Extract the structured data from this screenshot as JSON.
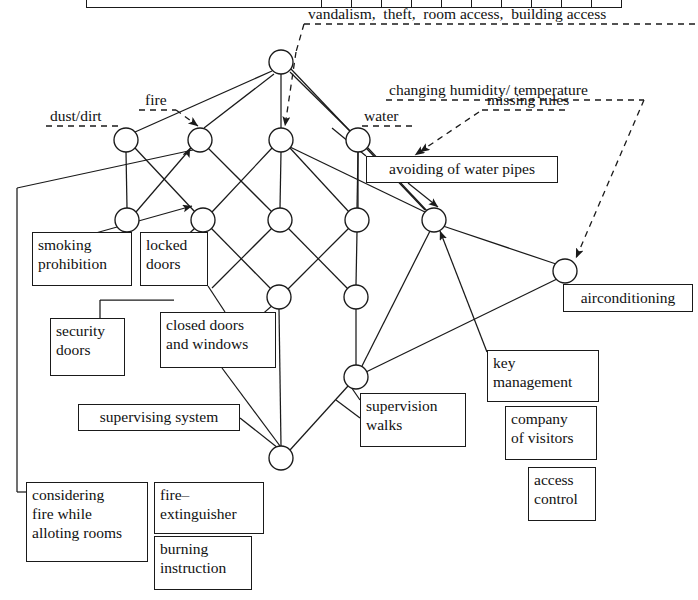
{
  "diagram": {
    "type": "node-link-diagram",
    "colors": {
      "line": "#1a1a1a",
      "node_fill": "#ffffff",
      "text": "#111111",
      "background": "#ffffff"
    }
  },
  "top_table": {
    "visible_fragment": "partially cropped table row at top of image",
    "columns": 11
  },
  "annotations": [
    {
      "id": "vandalism",
      "text": "vandalism,  theft,  room access,  building access",
      "x": 308,
      "y": 6,
      "style": "dashed-leader"
    },
    {
      "id": "humidity",
      "text": "changing humidity/ temperature",
      "x": 389,
      "y": 82,
      "style": "dashed-leader"
    },
    {
      "id": "missing",
      "text": "missing rules",
      "x": 487,
      "y": 92,
      "style": "dashed-leader"
    },
    {
      "id": "fire",
      "text": "fire",
      "x": 146,
      "y": 92,
      "style": "dashed-leader"
    },
    {
      "id": "dust",
      "text": "dust/dirt",
      "x": 51,
      "y": 108,
      "style": "dashed-leader"
    },
    {
      "id": "water",
      "text": "water",
      "x": 364,
      "y": 108,
      "style": "dashed-leader"
    }
  ],
  "boxes": [
    {
      "id": "avoiding-water-pipes",
      "text": "avoiding of water pipes",
      "x": 366,
      "y": 156,
      "w": 192,
      "h": 27
    },
    {
      "id": "smoking-prohibition",
      "text": "smoking\nprohibition",
      "x": 32,
      "y": 232,
      "w": 100,
      "h": 54
    },
    {
      "id": "locked-doors",
      "text": "locked\ndoors",
      "x": 140,
      "y": 232,
      "w": 68,
      "h": 54
    },
    {
      "id": "airconditioning",
      "text": "airconditioning",
      "x": 563,
      "y": 284,
      "w": 130,
      "h": 28
    },
    {
      "id": "security-doors",
      "text": "security\ndoors",
      "x": 50,
      "y": 318,
      "w": 75,
      "h": 58
    },
    {
      "id": "closed-doors-windows",
      "text": "closed doors\nand windows",
      "x": 160,
      "y": 312,
      "w": 116,
      "h": 56
    },
    {
      "id": "key-management",
      "text": "key\nmanagement",
      "x": 487,
      "y": 350,
      "w": 112,
      "h": 52
    },
    {
      "id": "supervising-system",
      "text": "supervising system",
      "x": 78,
      "y": 404,
      "w": 162,
      "h": 27
    },
    {
      "id": "supervision-walks",
      "text": "supervision\nwalks",
      "x": 360,
      "y": 393,
      "w": 106,
      "h": 54
    },
    {
      "id": "company-of-visitors",
      "text": "company\nof visitors",
      "x": 505,
      "y": 406,
      "w": 92,
      "h": 54
    },
    {
      "id": "access-control",
      "text": "access\ncontrol",
      "x": 528,
      "y": 467,
      "w": 68,
      "h": 54
    },
    {
      "id": "considering-fire",
      "text": "considering\nfire while\nalloting rooms",
      "x": 26,
      "y": 482,
      "w": 122,
      "h": 80
    },
    {
      "id": "fire-extinguisher",
      "text": "fire–\nextinguisher",
      "x": 154,
      "y": 482,
      "w": 110,
      "h": 52
    },
    {
      "id": "burning-instruction",
      "text": "burning\ninstruction",
      "x": 154,
      "y": 536,
      "w": 98,
      "h": 54
    }
  ],
  "nodes": [
    {
      "id": "n-top",
      "x": 281,
      "y": 62,
      "r": 12
    },
    {
      "id": "n2-a",
      "x": 126,
      "y": 140,
      "r": 12
    },
    {
      "id": "n2-b",
      "x": 200,
      "y": 140,
      "r": 12
    },
    {
      "id": "n2-c",
      "x": 281,
      "y": 140,
      "r": 12
    },
    {
      "id": "n2-d",
      "x": 358,
      "y": 140,
      "r": 12
    },
    {
      "id": "n3-a",
      "x": 127,
      "y": 220,
      "r": 12
    },
    {
      "id": "n3-b",
      "x": 203,
      "y": 220,
      "r": 12
    },
    {
      "id": "n3-c",
      "x": 280,
      "y": 220,
      "r": 12
    },
    {
      "id": "n3-d",
      "x": 357,
      "y": 220,
      "r": 12
    },
    {
      "id": "n3-e",
      "x": 434,
      "y": 220,
      "r": 12
    },
    {
      "id": "n4-a",
      "x": 279,
      "y": 297,
      "r": 12
    },
    {
      "id": "n4-b",
      "x": 356,
      "y": 297,
      "r": 12
    },
    {
      "id": "n-ac",
      "x": 565,
      "y": 271,
      "r": 12
    },
    {
      "id": "n5",
      "x": 356,
      "y": 377,
      "r": 12
    },
    {
      "id": "n-bot",
      "x": 281,
      "y": 458,
      "r": 12
    }
  ],
  "edges": [
    {
      "from": "n-top",
      "to": "n2-a",
      "arrow": false
    },
    {
      "from": "n-top",
      "to": "n2-b",
      "arrow": false
    },
    {
      "from": "n-top",
      "to": "n2-c",
      "arrow": false
    },
    {
      "from": "n-top",
      "to": "n2-d",
      "arrow": false
    },
    {
      "from": "n2-a",
      "to": "n3-a",
      "arrow": false
    },
    {
      "from": "n2-a",
      "to": "n3-b",
      "arrow": false
    },
    {
      "from": "n2-b",
      "to": "n3-a",
      "arrow": false
    },
    {
      "from": "n2-b",
      "to": "n3-c",
      "arrow": false
    },
    {
      "from": "n2-c",
      "to": "n3-b",
      "arrow": false
    },
    {
      "from": "n2-c",
      "to": "n3-c",
      "arrow": false
    },
    {
      "from": "n2-c",
      "to": "n3-d",
      "arrow": false
    },
    {
      "from": "n2-c",
      "to": "n3-e",
      "arrow": false
    },
    {
      "from": "n2-d",
      "to": "n3-d",
      "arrow": false
    },
    {
      "from": "n3-b",
      "to": "n4-a",
      "arrow": false
    },
    {
      "from": "n3-c",
      "to": "n4-a",
      "arrow": false
    },
    {
      "from": "n3-c",
      "to": "n4-b",
      "arrow": false
    },
    {
      "from": "n3-d",
      "to": "n4-b",
      "arrow": false
    },
    {
      "from": "n3-e",
      "to": "n-ac",
      "arrow": false
    },
    {
      "from": "n4-b",
      "to": "n5",
      "arrow": false
    },
    {
      "from": "n5",
      "to": "n-bot",
      "arrow": false
    },
    {
      "from": "n4-a",
      "to": "n-bot",
      "arrow": false
    },
    {
      "from": "n3-e",
      "to": "n5",
      "arrow": false
    },
    {
      "from": "n-ac",
      "to": "n5",
      "arrow": false
    }
  ],
  "pointer_arrows": [
    {
      "id": "arrow-to-n2-b",
      "desc": "fire leader into node row2-b"
    },
    {
      "id": "arrow-to-n2-c",
      "desc": "vandalism leader into node row2-c"
    },
    {
      "id": "arrow-to-n3-e",
      "desc": "avoiding water pipes into node row3-e"
    },
    {
      "id": "arrow-to-ac",
      "desc": "missing rules into airconditioning node"
    },
    {
      "id": "arrow-from-considering-fire",
      "desc": "considering fire while alloting rooms up to node row2-b"
    },
    {
      "id": "arrow-from-supervising-system",
      "desc": "supervising system up to node row4-b"
    },
    {
      "id": "arrow-from-key-management",
      "desc": "key management up to node row3-e"
    }
  ]
}
